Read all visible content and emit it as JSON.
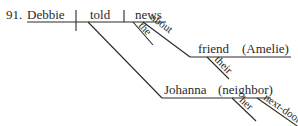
{
  "diagram": {
    "number": "91.",
    "subject": "Debbie",
    "verb": "told",
    "direct_object": "news",
    "modifiers": {
      "news_article": "the",
      "preposition": "about",
      "prep_object": "friend",
      "prep_object_appositive": "(Amelie)",
      "friend_possessive": "their",
      "indirect_object": "Johanna",
      "indirect_object_appositive": "(neighbor)",
      "neighbor_possessive": "her",
      "neighbor_adjective": "next-door"
    },
    "colors": {
      "ink": "#2a2a2a",
      "background": "#ffffff"
    }
  }
}
